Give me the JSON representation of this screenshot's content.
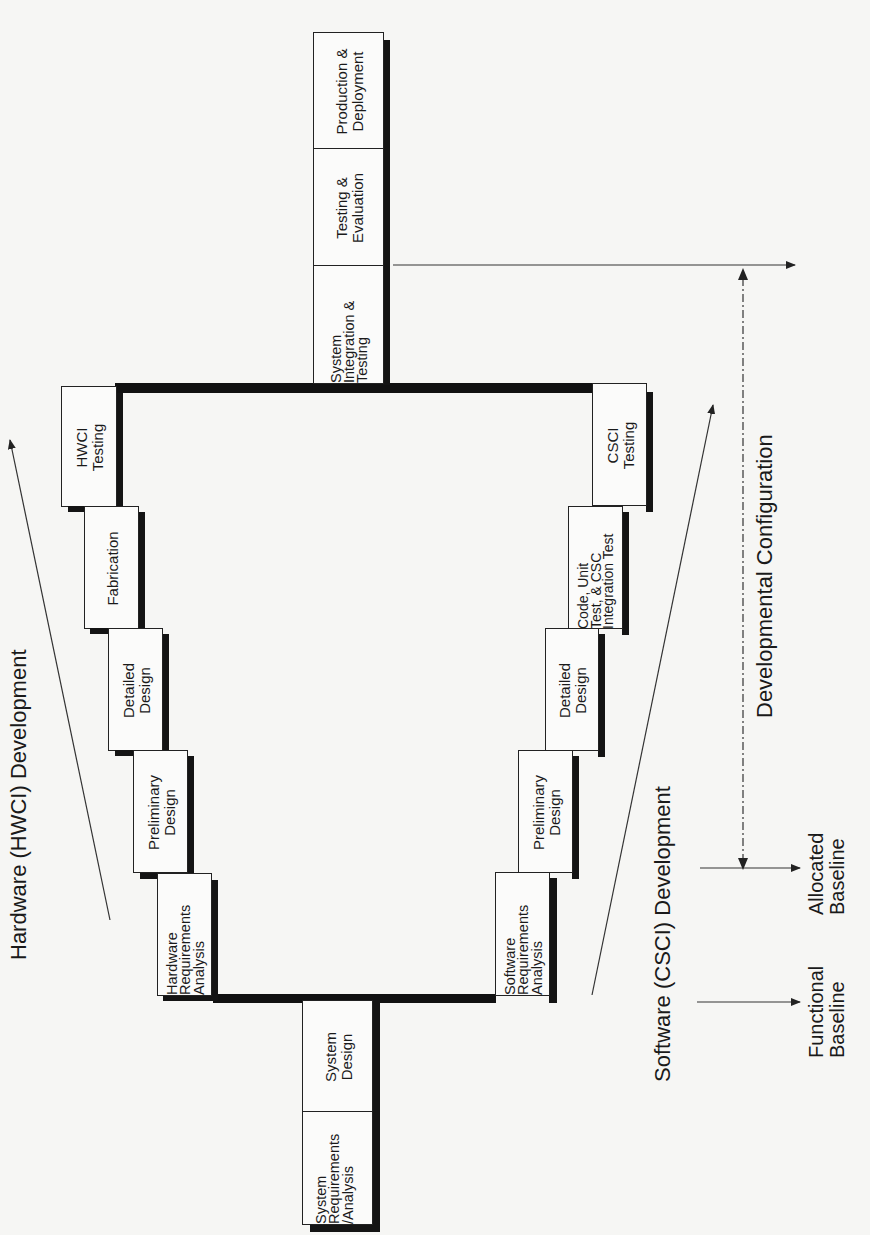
{
  "diagram": {
    "orientation": "rotated-90-ccw",
    "system_column_top": [
      {
        "id": "production-deployment",
        "lines": [
          "Production &",
          "Deployment"
        ]
      },
      {
        "id": "testing-evaluation",
        "lines": [
          "Testing &",
          "Evaluation"
        ]
      },
      {
        "id": "system-integration-testing",
        "lines": [
          "System",
          "Integration &",
          "Testing"
        ]
      }
    ],
    "system_column_bottom": [
      {
        "id": "system-design",
        "lines": [
          "System",
          "Design"
        ]
      },
      {
        "id": "system-requirements-analysis",
        "lines": [
          "System",
          "Requirements",
          "/Analysis"
        ]
      }
    ],
    "hardware_steps": [
      {
        "id": "hwci-testing",
        "lines": [
          "HWCI",
          "Testing"
        ]
      },
      {
        "id": "fabrication",
        "lines": [
          "Fabrication"
        ]
      },
      {
        "id": "hw-detailed-design",
        "lines": [
          "Detailed",
          "Design"
        ]
      },
      {
        "id": "hw-preliminary-design",
        "lines": [
          "Preliminary",
          "Design"
        ]
      },
      {
        "id": "hardware-requirements-analysis",
        "lines": [
          "Hardware",
          "Requirements",
          "Analysis"
        ]
      }
    ],
    "software_steps": [
      {
        "id": "csci-testing",
        "lines": [
          "CSCI",
          "Testing"
        ]
      },
      {
        "id": "code-unit-test",
        "lines": [
          "Code, Unit",
          "Test, & CSC",
          "Integration Test"
        ]
      },
      {
        "id": "sw-detailed-design",
        "lines": [
          "Detailed",
          "Design"
        ]
      },
      {
        "id": "sw-preliminary-design",
        "lines": [
          "Preliminary",
          "Design"
        ]
      },
      {
        "id": "software-requirements-analysis",
        "lines": [
          "Software",
          "Requirements",
          "Analysis"
        ]
      }
    ],
    "labels": {
      "hardware_development": "Hardware (HWCI)  Development",
      "software_development": "Software  (CSCI)  Development",
      "developmental_configuration": "Developmental Configuration",
      "functional_baseline": [
        "Functional",
        "Baseline"
      ],
      "allocated_baseline": [
        "Allocated",
        "Baseline"
      ]
    },
    "colors": {
      "ink": "#111111",
      "paper": "#f6f6f4",
      "box": "#fbfbfa"
    }
  }
}
